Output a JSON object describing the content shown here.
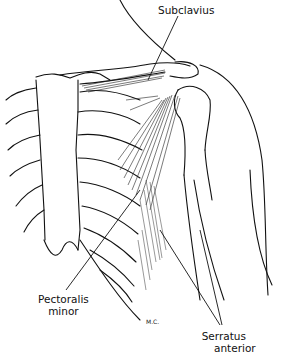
{
  "figure": {
    "type": "anatomical-line-drawing",
    "labels": [
      {
        "id": "subclavius",
        "lines": [
          "Subclavius"
        ]
      },
      {
        "id": "pectoralis_minor",
        "lines": [
          "Pectoralis",
          "minor"
        ]
      },
      {
        "id": "serratus_anterior",
        "lines": [
          "Serratus",
          "anterior"
        ]
      }
    ],
    "signature": "M.C."
  }
}
